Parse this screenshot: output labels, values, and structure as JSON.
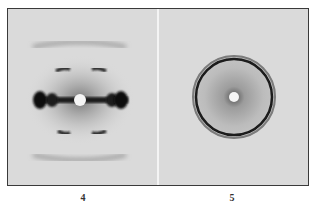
{
  "figure": {
    "panels": [
      {
        "id": "4",
        "label": "4",
        "description": "X-ray fiber diffraction pattern with horizontal equatorial streak, layer-line arcs above and below, bright central spot"
      },
      {
        "id": "5",
        "label": "5",
        "description": "Powder-style diffraction pattern with concentric dark ring and diffuse halo around bright central spot"
      }
    ]
  },
  "colors": {
    "background": "#dadada",
    "frame": "#3a3a3a",
    "dark": "#1a1a1a"
  }
}
